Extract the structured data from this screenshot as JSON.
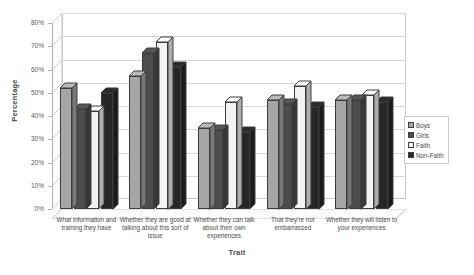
{
  "chart_data": {
    "type": "bar",
    "title": "",
    "xlabel": "Trait",
    "ylabel": "Percentage",
    "ylim": [
      0,
      80
    ],
    "ytick_labels": [
      "0%",
      "10%",
      "20%",
      "30%",
      "40%",
      "50%",
      "60%",
      "70%",
      "80%"
    ],
    "ytick_values": [
      0,
      10,
      20,
      30,
      40,
      50,
      60,
      70,
      80
    ],
    "grid": true,
    "legend_position": "right",
    "style": "3d-clustered-column",
    "categories": [
      "What information and training they have",
      "Whether they are good at talking about this sort of issue",
      "Whether they can talk about their own experiences",
      "That they're not embarrassed",
      "Whether they will listen to your experiences"
    ],
    "series": [
      {
        "name": "Boys",
        "color": "#a6a6a6",
        "values": [
          52,
          57,
          35,
          47,
          47
        ]
      },
      {
        "name": "Girls",
        "color": "#4d4d4d",
        "values": [
          43,
          67,
          34,
          45,
          47
        ]
      },
      {
        "name": "Faith",
        "color": "#f2f2f2",
        "values": [
          42,
          72,
          46,
          53,
          49
        ]
      },
      {
        "name": "Non-Faith",
        "color": "#262626",
        "values": [
          50,
          61,
          33,
          44,
          46
        ]
      }
    ]
  },
  "legend": {
    "items": [
      {
        "label": "Boys"
      },
      {
        "label": "Girls"
      },
      {
        "label": "Faith"
      },
      {
        "label": "Non-Faith"
      }
    ]
  }
}
